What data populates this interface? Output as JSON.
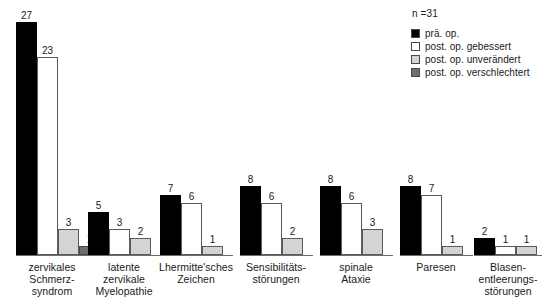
{
  "legend": {
    "n_label": "n =31",
    "items": [
      {
        "label": "prä. op.",
        "color": "#000000",
        "key": "pra-op"
      },
      {
        "label": "post. op. gebessert",
        "color": "#ffffff",
        "key": "post-op-gebessert"
      },
      {
        "label": "post. op. unverändert",
        "color": "#d4d4d4",
        "key": "post-op-unveraendert"
      },
      {
        "label": "post. op. verschlechtert",
        "color": "#6e6e6e",
        "key": "post-op-verschlechtert"
      }
    ]
  },
  "chart_data": {
    "type": "bar",
    "title": "",
    "xlabel": "",
    "ylabel": "",
    "ylim": [
      0,
      27
    ],
    "grid": false,
    "legend_position": "top-right",
    "annotations": [
      "n =31"
    ],
    "categories": [
      "zervikales\nSchmerz-\nsyndrom",
      "latente\nzervikale\nMyelopathie",
      "Lhermitte'sches\nZeichen",
      "Sensibilitäts-\nstörungen",
      "spinale\nAtaxie",
      "Paresen",
      "Blasen-\nentleerungs-\nstörungen"
    ],
    "series": [
      {
        "name": "prä. op.",
        "color": "#000000",
        "values": [
          27,
          5,
          7,
          8,
          8,
          8,
          2
        ]
      },
      {
        "name": "post. op. gebessert",
        "color": "#ffffff",
        "values": [
          23,
          3,
          6,
          6,
          6,
          7,
          1
        ]
      },
      {
        "name": "post. op. unverändert",
        "color": "#d4d4d4",
        "values": [
          3,
          2,
          1,
          2,
          3,
          1,
          1
        ]
      },
      {
        "name": "post. op. verschlechtert",
        "color": "#6e6e6e",
        "values": [
          1,
          null,
          null,
          null,
          null,
          null,
          null
        ]
      }
    ]
  },
  "layout": {
    "baseline_y": 255,
    "px_per_unit": 8.62,
    "bar_width": 21,
    "groups": [
      {
        "x": 16,
        "axis_width": 73,
        "label_x": 2,
        "label_w": 100
      },
      {
        "x": 88,
        "axis_width": 73,
        "label_x": 74,
        "label_w": 100
      },
      {
        "x": 160,
        "axis_width": 73,
        "label_x": 146,
        "label_w": 100
      },
      {
        "x": 240,
        "axis_width": 73,
        "label_x": 226,
        "label_w": 100
      },
      {
        "x": 320,
        "axis_width": 73,
        "label_x": 306,
        "label_w": 100
      },
      {
        "x": 400,
        "axis_width": 73,
        "label_x": 386,
        "label_w": 100
      },
      {
        "x": 474,
        "axis_width": 68,
        "label_x": 458,
        "label_w": 100
      }
    ]
  }
}
